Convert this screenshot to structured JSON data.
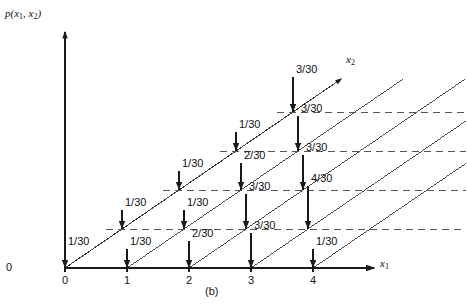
{
  "figure": {
    "caption": "(b)",
    "origin_label": "0",
    "yaxis_label_parts": {
      "fn": "p(",
      "v1": "x",
      "v1sub": "1",
      "sep": ", ",
      "v2": "x",
      "v2sub": "2",
      "close": ")"
    },
    "xaxis1_label": {
      "name": "x",
      "sub": "1"
    },
    "xaxis2_label": {
      "name": "x",
      "sub": "2"
    }
  },
  "chart_data": {
    "type": "scatter",
    "title": "p(x1, x2)",
    "subtitle": "(b)",
    "xlabel": "x₁",
    "ylabel": "p(x₁, x₂)",
    "zlabel": "x₂",
    "grid": false,
    "legend": "none",
    "projection": "oblique-3d-stem",
    "x1_ticks": [
      "0",
      "1",
      "2",
      "3",
      "4"
    ],
    "x1_values": [
      0,
      1,
      2,
      3,
      4
    ],
    "x2_values": [
      0,
      1,
      2,
      3,
      4
    ],
    "value_denominator": 30,
    "points": [
      {
        "x1": 0,
        "x2": 0,
        "label": "1/30",
        "numerator": 1
      },
      {
        "x1": 1,
        "x2": 0,
        "label": "1/30",
        "numerator": 1
      },
      {
        "x1": 2,
        "x2": 0,
        "label": "2/30",
        "numerator": 2
      },
      {
        "x1": 3,
        "x2": 0,
        "label": "3/30",
        "numerator": 3
      },
      {
        "x1": 4,
        "x2": 0,
        "label": "1/30",
        "numerator": 1
      },
      {
        "x1": 0,
        "x2": 1,
        "label": "1/30",
        "numerator": 1
      },
      {
        "x1": 1,
        "x2": 1,
        "label": "1/30",
        "numerator": 1
      },
      {
        "x1": 2,
        "x2": 1,
        "label": "3/30",
        "numerator": 3
      },
      {
        "x1": 3,
        "x2": 1,
        "label": "4/30",
        "numerator": 4
      },
      {
        "x1": 0,
        "x2": 2,
        "label": "1/30",
        "numerator": 1
      },
      {
        "x1": 1,
        "x2": 2,
        "label": "2/30",
        "numerator": 2
      },
      {
        "x1": 2,
        "x2": 2,
        "label": "3/30",
        "numerator": 3
      },
      {
        "x1": 0,
        "x2": 3,
        "label": "1/30",
        "numerator": 1
      },
      {
        "x1": 1,
        "x2": 3,
        "label": "3/30",
        "numerator": 3
      },
      {
        "x1": 0,
        "x2": 4,
        "label": "3/30",
        "numerator": 3
      }
    ],
    "colors": {
      "axis": "#1a1a1a",
      "stem": "#1a1a1a",
      "diagonal": "#3a3a3a",
      "dashed": "#555555",
      "text": "#111111"
    }
  }
}
